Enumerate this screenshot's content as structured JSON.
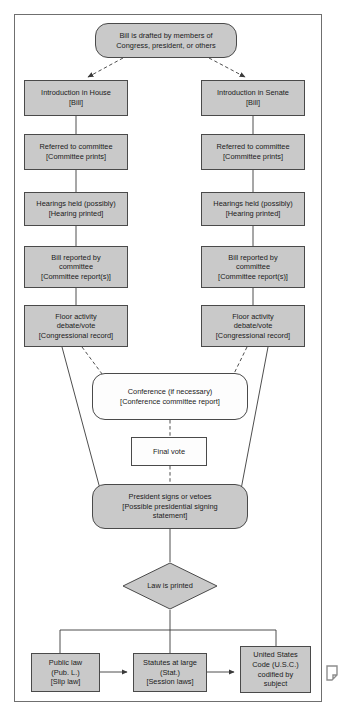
{
  "diagram": {
    "colors": {
      "node_fill": "#c9c9c9",
      "node_fill_plain": "#fdfdfd",
      "node_stroke": "#4a4a4a",
      "connector": "#3a3a3a",
      "frame": "#6f6f6f",
      "text": "#1b1b1b",
      "page_background": "#ffffff"
    },
    "nodes": {
      "origin": "Bill is drafted by members of\nCongress, president, or others",
      "house_intro": "Introduction in House\n[Bill]",
      "senate_intro": "Introduction in Senate\n[Bill]",
      "house_committee": "Referred to committee\n[Committee prints]",
      "senate_committee": "Referred to committee\n[Committee prints]",
      "house_hearings": "Hearings held (possibly)\n[Hearing printed]",
      "senate_hearings": "Hearings held (possibly)\n[Hearing printed]",
      "house_reported": "Bill reported by\ncommittee\n[Committee report(s)]",
      "senate_reported": "Bill reported by\ncommittee\n[Committee report(s)]",
      "house_floor": "Floor activity\ndebate/vote\n[Congressional record]",
      "senate_floor": "Floor activity\ndebate/vote\n[Congressional record]",
      "conference": "Conference (if necessary)\n[Conference committee report]",
      "final_vote": "Final vote",
      "president": "President signs or vetoes\n[Possible presidential signing\nstatement]",
      "law_printed": "Law is printed",
      "public_law": "Public law\n(Pub. L.)\n[Slip law]",
      "statutes": "Statutes at large\n(Stat.)\n[Session laws]",
      "usc": "United States\nCode (U.S.C.)\ncodified by\nsubject"
    },
    "edges": [
      {
        "from": "origin",
        "to": "house_intro",
        "style": "dashed"
      },
      {
        "from": "origin",
        "to": "senate_intro",
        "style": "dashed"
      },
      {
        "from": "house_intro",
        "to": "house_committee",
        "style": "solid"
      },
      {
        "from": "house_committee",
        "to": "house_hearings",
        "style": "solid"
      },
      {
        "from": "house_hearings",
        "to": "house_reported",
        "style": "solid"
      },
      {
        "from": "house_reported",
        "to": "house_floor",
        "style": "solid"
      },
      {
        "from": "senate_intro",
        "to": "senate_committee",
        "style": "solid"
      },
      {
        "from": "senate_committee",
        "to": "senate_hearings",
        "style": "solid"
      },
      {
        "from": "senate_hearings",
        "to": "senate_reported",
        "style": "solid"
      },
      {
        "from": "senate_reported",
        "to": "senate_floor",
        "style": "solid"
      },
      {
        "from": "house_floor",
        "to": "conference",
        "style": "dashed"
      },
      {
        "from": "senate_floor",
        "to": "conference",
        "style": "dashed"
      },
      {
        "from": "house_floor",
        "to": "president",
        "style": "solid"
      },
      {
        "from": "senate_floor",
        "to": "president",
        "style": "solid"
      },
      {
        "from": "conference",
        "to": "final_vote",
        "style": "dashed"
      },
      {
        "from": "final_vote",
        "to": "president",
        "style": "dashed"
      },
      {
        "from": "president",
        "to": "law_printed",
        "style": "solid"
      },
      {
        "from": "law_printed",
        "to": "public_law",
        "style": "solid"
      },
      {
        "from": "law_printed",
        "to": "statutes",
        "style": "solid"
      },
      {
        "from": "law_printed",
        "to": "usc",
        "style": "solid"
      },
      {
        "from": "public_law",
        "to": "statutes",
        "style": "solid"
      },
      {
        "from": "statutes",
        "to": "usc",
        "style": "solid"
      }
    ]
  }
}
